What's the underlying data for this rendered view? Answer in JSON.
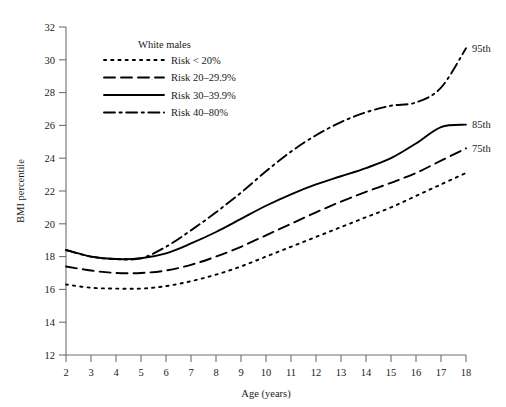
{
  "chart_data": {
    "type": "line",
    "title": "",
    "xlabel": "Age (years)",
    "ylabel": "BMI percentile",
    "xlim": [
      2,
      18
    ],
    "ylim": [
      12,
      32
    ],
    "grid": false,
    "legend_position": "upper-left",
    "legend_title": "White males",
    "x_ticks": [
      "2",
      "3",
      "4",
      "5",
      "6",
      "7",
      "8",
      "9",
      "10",
      "11",
      "12",
      "13",
      "14",
      "15",
      "16",
      "17",
      "18"
    ],
    "y_ticks": [
      "12",
      "14",
      "16",
      "18",
      "20",
      "22",
      "24",
      "26",
      "28",
      "30",
      "32"
    ],
    "x": [
      2,
      3,
      4,
      5,
      6,
      7,
      8,
      9,
      10,
      11,
      12,
      13,
      14,
      15,
      16,
      17,
      18
    ],
    "series": [
      {
        "name": "Risk < 20%",
        "style": "dotted",
        "end_label": "75th",
        "values": [
          16.3,
          16.1,
          16.05,
          16.05,
          16.2,
          16.5,
          16.9,
          17.4,
          18.0,
          18.6,
          19.2,
          19.8,
          20.4,
          21.0,
          21.7,
          22.4,
          23.1
        ]
      },
      {
        "name": "Risk 20–29.9%",
        "style": "dashed",
        "end_label": "75th",
        "values": [
          17.4,
          17.15,
          17.0,
          17.0,
          17.15,
          17.5,
          18.0,
          18.6,
          19.3,
          20.0,
          20.7,
          21.35,
          21.95,
          22.5,
          23.1,
          23.85,
          24.6
        ]
      },
      {
        "name": "Risk 30–39.9%",
        "style": "solid",
        "end_label": "85th",
        "values": [
          18.4,
          18.0,
          17.85,
          17.9,
          18.2,
          18.8,
          19.5,
          20.3,
          21.1,
          21.8,
          22.4,
          22.9,
          23.4,
          24.0,
          24.9,
          25.9,
          26.05
        ]
      },
      {
        "name": "Risk 40–80%",
        "style": "dashdot",
        "end_label": "95th",
        "values": [
          18.4,
          18.0,
          17.85,
          17.9,
          18.6,
          19.6,
          20.7,
          21.9,
          23.2,
          24.4,
          25.4,
          26.2,
          26.8,
          27.2,
          27.4,
          28.3,
          30.7
        ]
      }
    ],
    "end_labels": [
      {
        "text": "95th",
        "value": 30.7
      },
      {
        "text": "85th",
        "value": 26.05
      },
      {
        "text": "75th",
        "value": 24.6
      }
    ]
  }
}
